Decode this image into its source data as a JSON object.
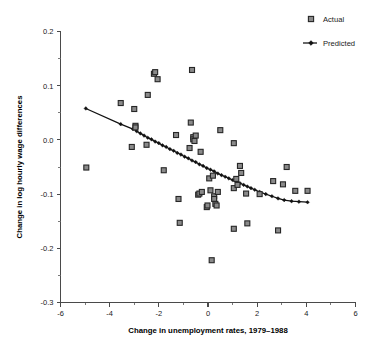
{
  "chart_data": {
    "type": "scatter",
    "title": "",
    "xlabel": "Change in unemployment rates, 1979–1988",
    "ylabel": "Change in log hourly wage differences",
    "xlim": [
      -6,
      6
    ],
    "ylim": [
      -0.3,
      0.2
    ],
    "grid": false,
    "legend_position": "top-right",
    "x_ticks": [
      -6,
      -4,
      -2,
      0,
      2,
      4,
      6
    ],
    "x_tick_labels": [
      "-6",
      "-4",
      "-2",
      "0",
      "2",
      "4",
      "6"
    ],
    "x_minor_ticks": [
      -5,
      -3,
      -1,
      1,
      3,
      5
    ],
    "y_ticks": [
      0.2,
      0.1,
      0.0,
      -0.1,
      -0.2,
      -0.3
    ],
    "y_tick_labels": [
      "0.2",
      "0.1",
      "0.0",
      "-0.1",
      "-0.2",
      "-0.3"
    ],
    "y_minor_ticks": [
      0.15,
      0.05,
      -0.05,
      -0.15,
      -0.25
    ],
    "series": [
      {
        "name": "Actual",
        "type": "scatter",
        "marker": "square",
        "marker_fill": "#8a8a8a",
        "marker_edge": "#262626",
        "points": [
          [
            -4.95,
            -0.051
          ],
          [
            -3.55,
            0.068
          ],
          [
            -3.1,
            -0.013
          ],
          [
            -3.0,
            0.057
          ],
          [
            -2.95,
            0.026
          ],
          [
            -2.95,
            0.023
          ],
          [
            -2.5,
            -0.009
          ],
          [
            -2.45,
            0.083
          ],
          [
            -2.2,
            0.122
          ],
          [
            -2.15,
            0.125
          ],
          [
            -2.05,
            0.112
          ],
          [
            -1.8,
            -0.056
          ],
          [
            -1.3,
            0.009
          ],
          [
            -1.2,
            -0.109
          ],
          [
            -1.15,
            -0.153
          ],
          [
            -0.75,
            -0.015
          ],
          [
            -0.7,
            0.032
          ],
          [
            -0.65,
            0.129
          ],
          [
            -0.6,
            0.005
          ],
          [
            -0.6,
            0.001
          ],
          [
            -0.55,
            -0.002
          ],
          [
            -0.5,
            0.008
          ],
          [
            -0.4,
            -0.101
          ],
          [
            -0.35,
            -0.099
          ],
          [
            -0.3,
            -0.022
          ],
          [
            -0.25,
            -0.096
          ],
          [
            -0.05,
            -0.124
          ],
          [
            -0.02,
            -0.121
          ],
          [
            0.05,
            -0.071
          ],
          [
            0.1,
            -0.093
          ],
          [
            0.15,
            -0.222
          ],
          [
            0.2,
            -0.066
          ],
          [
            0.25,
            -0.104
          ],
          [
            0.25,
            -0.109
          ],
          [
            0.3,
            -0.118
          ],
          [
            0.35,
            -0.121
          ],
          [
            0.4,
            -0.096
          ],
          [
            0.5,
            0.018
          ],
          [
            1.05,
            -0.006
          ],
          [
            1.05,
            -0.089
          ],
          [
            1.05,
            -0.164
          ],
          [
            1.15,
            -0.072
          ],
          [
            1.2,
            -0.083
          ],
          [
            1.3,
            -0.048
          ],
          [
            1.35,
            -0.061
          ],
          [
            1.55,
            -0.099
          ],
          [
            1.6,
            -0.154
          ],
          [
            2.1,
            -0.1
          ],
          [
            2.65,
            -0.076
          ],
          [
            2.85,
            -0.167
          ],
          [
            3.05,
            -0.082
          ],
          [
            3.2,
            -0.05
          ],
          [
            3.55,
            -0.094
          ],
          [
            4.05,
            -0.094
          ]
        ]
      },
      {
        "name": "Predicted",
        "type": "line",
        "marker": "diamond",
        "line_color": "#111111",
        "points": [
          [
            -4.97,
            0.058
          ],
          [
            -3.55,
            0.029
          ],
          [
            -3.05,
            0.02
          ],
          [
            -2.9,
            0.016
          ],
          [
            -2.75,
            0.012
          ],
          [
            -2.6,
            0.008
          ],
          [
            -2.45,
            0.004
          ],
          [
            -2.3,
            0.001
          ],
          [
            -2.15,
            -0.003
          ],
          [
            -2.0,
            -0.006
          ],
          [
            -1.85,
            -0.01
          ],
          [
            -1.7,
            -0.013
          ],
          [
            -1.55,
            -0.017
          ],
          [
            -1.4,
            -0.02
          ],
          [
            -1.25,
            -0.024
          ],
          [
            -1.1,
            -0.027
          ],
          [
            -0.95,
            -0.031
          ],
          [
            -0.8,
            -0.034
          ],
          [
            -0.65,
            -0.038
          ],
          [
            -0.5,
            -0.041
          ],
          [
            -0.35,
            -0.045
          ],
          [
            -0.2,
            -0.048
          ],
          [
            -0.05,
            -0.052
          ],
          [
            0.1,
            -0.055
          ],
          [
            0.25,
            -0.058
          ],
          [
            0.4,
            -0.062
          ],
          [
            0.55,
            -0.065
          ],
          [
            0.7,
            -0.068
          ],
          [
            0.85,
            -0.071
          ],
          [
            1.0,
            -0.074
          ],
          [
            1.15,
            -0.077
          ],
          [
            1.3,
            -0.08
          ],
          [
            1.45,
            -0.083
          ],
          [
            1.6,
            -0.086
          ],
          [
            1.75,
            -0.089
          ],
          [
            1.9,
            -0.092
          ],
          [
            2.1,
            -0.096
          ],
          [
            2.35,
            -0.1
          ],
          [
            2.6,
            -0.104
          ],
          [
            2.85,
            -0.108
          ],
          [
            3.1,
            -0.111
          ],
          [
            3.4,
            -0.113
          ],
          [
            3.7,
            -0.114
          ],
          [
            4.05,
            -0.115
          ]
        ]
      }
    ]
  },
  "legend": {
    "items": [
      {
        "label": "Actual",
        "marker": "square"
      },
      {
        "label": "Predicted",
        "marker": "line-diamond"
      }
    ]
  }
}
